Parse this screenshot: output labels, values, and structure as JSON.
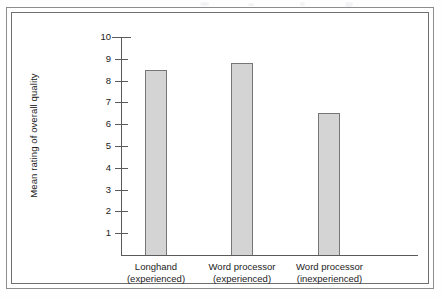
{
  "figure": {
    "kind": "scanned-textbook-bar-chart",
    "frame_color": "#6e6e6e",
    "background": "#ffffff"
  },
  "chart_data": {
    "type": "bar",
    "title": "",
    "subtitle": "",
    "xlabel": "",
    "ylabel": "Mean rating of overall quality",
    "categories": [
      "Longhand (experienced)",
      "Word processor (experienced)",
      "Word processor (inexperienced)"
    ],
    "category_lines": [
      [
        "Longhand",
        "(experienced)"
      ],
      [
        "Word processor",
        "(experienced)"
      ],
      [
        "Word processor",
        "(inexperienced)"
      ]
    ],
    "values": [
      8.5,
      8.8,
      6.5
    ],
    "ylim": [
      0,
      10
    ],
    "ytick_labels": [
      "10",
      "9",
      "8",
      "7",
      "6",
      "5",
      "4",
      "3",
      "2",
      "1"
    ],
    "ytick_values": [
      10,
      9,
      8,
      7,
      6,
      5,
      4,
      3,
      2,
      1
    ],
    "grid": false,
    "legend": false,
    "legend_position": "none",
    "bar_fill": "#d4d4d4",
    "bar_edge": "#767676",
    "axis_color": "#5a5a5a"
  },
  "axis": {
    "y_label_text": "Mean rating of overall quality"
  }
}
